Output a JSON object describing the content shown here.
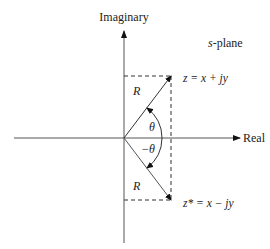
{
  "diagram": {
    "plane_label_italic": "s",
    "plane_label_rest": "-plane",
    "axes": {
      "vertical_label": "Imaginary",
      "horizontal_label": "Real"
    },
    "points": {
      "z": {
        "label_var": "z",
        "label_eq": " = x + jy"
      },
      "z_conj": {
        "label_var": "z*",
        "label_eq": " = x − jy"
      }
    },
    "magnitude_upper": "R",
    "magnitude_lower": "R",
    "angle_upper": "θ",
    "angle_lower": "−θ",
    "colors": {
      "line": "#222222",
      "dashed": "#333333",
      "text": "#222222"
    }
  }
}
